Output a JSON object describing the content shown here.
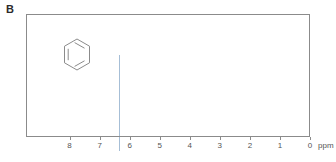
{
  "panel": {
    "label": "B"
  },
  "molecule": {
    "name": "benzene-ring-structure",
    "caption": "benzene"
  },
  "axis": {
    "unit": "ppm",
    "tick_labels": [
      "8",
      "7",
      "6",
      "5",
      "4",
      "3",
      "2",
      "1",
      "0"
    ],
    "tick_values": [
      8,
      7,
      6,
      5,
      4,
      3,
      2,
      1,
      0
    ],
    "min": 0,
    "max": 9.45,
    "direction": "reversed"
  },
  "colors": {
    "peak": "#a6bed6",
    "frame": "#8b8b8b",
    "text": "#555555",
    "label": "#2b2b2b",
    "background": "#ffffff"
  },
  "chart_data": {
    "type": "line",
    "title": "B",
    "xlabel": "ppm",
    "ylabel": "",
    "xlim": [
      9.45,
      0
    ],
    "ylim": [
      0,
      1
    ],
    "grid": false,
    "legend": "none",
    "annotations": [
      "benzene ring structure drawn at upper left of plot"
    ],
    "series": [
      {
        "name": "1H NMR spectrum",
        "peaks": [
          {
            "x": 7.26,
            "height": 0.79,
            "label": ""
          }
        ]
      }
    ]
  }
}
